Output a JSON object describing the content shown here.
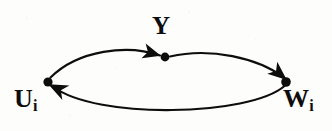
{
  "figure": {
    "kind": "directed-graph-diagram",
    "background_color": "#fdfdfc",
    "ink_color": "#0d0d0d",
    "width": 332,
    "height": 131
  },
  "nodes": [
    {
      "id": "u",
      "label": "U",
      "subscript": "i",
      "x": 48,
      "y": 82,
      "radius": 4.6,
      "label_position": "below-left"
    },
    {
      "id": "y",
      "label": "Y",
      "subscript": "",
      "x": 165,
      "y": 57,
      "radius": 4.4,
      "label_position": "above"
    },
    {
      "id": "w",
      "label": "W",
      "subscript": "i",
      "x": 286,
      "y": 82,
      "radius": 4.8,
      "label_position": "below-right"
    }
  ],
  "edges": [
    {
      "id": "edge-u-to-y",
      "from": "u",
      "to": "y",
      "arrowhead": "at-target",
      "curvature": "arc-upward",
      "path": "M 50.5 77.6 C 78 50 128 44 160 55.5"
    },
    {
      "id": "edge-y-to-w",
      "from": "y",
      "to": "w",
      "arrowhead": "at-target",
      "curvature": "arc-upward",
      "path": "M 170 56.5 C 210 47 258 58 284 77.5"
    },
    {
      "id": "edge-w-to-u",
      "from": "w",
      "to": "u",
      "arrowhead": "at-target",
      "curvature": "arc-downward",
      "path": "M 284.5 86 C 250 116 96 120 53 86.5"
    }
  ],
  "arrowheads": [
    {
      "id": "arrowhead-into-y",
      "target_node": "y",
      "x": 158,
      "y": 55,
      "rotation_deg": 16
    },
    {
      "id": "arrowhead-into-w",
      "target_node": "w",
      "x": 283,
      "y": 76,
      "rotation_deg": 40
    },
    {
      "id": "arrowhead-into-u",
      "target_node": "u",
      "x": 52,
      "y": 86,
      "rotation_deg": 208
    }
  ]
}
